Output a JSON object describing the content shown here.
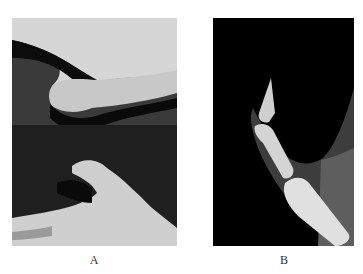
{
  "figure": {
    "panels": [
      {
        "id": "A",
        "label": "A",
        "description": "Photographs of thumb: lateral view (top) and palmar view (bottom) showing flexed interphalangeal joint"
      },
      {
        "id": "B",
        "label": "B",
        "description": "Lateral radiograph of thumb showing flexed distal phalanx"
      }
    ]
  }
}
